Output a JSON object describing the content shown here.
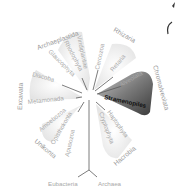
{
  "diagram": {
    "type": "unrooted-phylogenetic-tree",
    "highlight_color": "#444444",
    "highlighted_clade": "Chromalveolata",
    "highlighted_taxon": "Stramenopiles",
    "supergroups": [
      {
        "name": "Archaeplastida",
        "members": [
          "Viridiplantae",
          "Rhodophyta",
          "Glaucophyta"
        ]
      },
      {
        "name": "Rhizaria",
        "members": [
          "Cercozoa",
          "Retaria"
        ]
      },
      {
        "name": "Chromalveolata",
        "members": [
          "Alveolata",
          "Stramenopiles"
        ]
      },
      {
        "name": "Hacrobia",
        "members": [
          "Haptophyta",
          "Cryptophyta"
        ]
      },
      {
        "name": "Unikonta",
        "members": [
          "Amoebozoa",
          "Opisthokonta",
          "Apusozoa"
        ]
      },
      {
        "name": "Excavata",
        "members": [
          "Discoba",
          "Metamonada"
        ]
      }
    ],
    "outgroups": [
      "Eubacteria",
      "Archaea"
    ]
  }
}
